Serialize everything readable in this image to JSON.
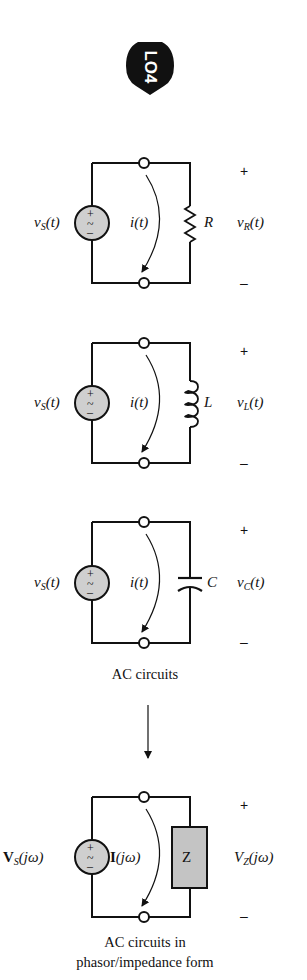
{
  "badge": {
    "label": "LO4",
    "icon": "learning-objective-arrow-icon"
  },
  "circuits": [
    {
      "type": "resistor",
      "source_label": {
        "main": "v",
        "sub": "S",
        "arg": "(t)"
      },
      "current_label": "i(t)",
      "element_label": "R",
      "voltage_label": {
        "main": "v",
        "sub": "R",
        "arg": "(t)"
      },
      "plus": "+",
      "minus": "–"
    },
    {
      "type": "inductor",
      "source_label": {
        "main": "v",
        "sub": "S",
        "arg": "(t)"
      },
      "current_label": "i(t)",
      "element_label": "L",
      "voltage_label": {
        "main": "v",
        "sub": "L",
        "arg": "(t)"
      },
      "plus": "+",
      "minus": "–"
    },
    {
      "type": "capacitor",
      "source_label": {
        "main": "v",
        "sub": "S",
        "arg": "(t)"
      },
      "current_label": "i(t)",
      "element_label": "C",
      "voltage_label": {
        "main": "v",
        "sub": "C",
        "arg": "(t)"
      },
      "plus": "+",
      "minus": "–"
    },
    {
      "type": "impedance",
      "source_label": {
        "main": "V",
        "sub": "S",
        "arg": "(jω)"
      },
      "current_label": {
        "main": "I",
        "arg": "(jω)"
      },
      "element_label": "Z",
      "voltage_label": {
        "main": "V",
        "sub": "Z",
        "arg": "(jω)"
      },
      "plus": "+",
      "minus": "–"
    }
  ],
  "captions": {
    "ac_circuits": "AC circuits",
    "phasor_line1": "AC circuits in",
    "phasor_line2": "phasor/impedance form"
  },
  "source_symbol": {
    "plus": "+",
    "tilde": "~",
    "minus": "–"
  },
  "colors": {
    "source_fill": "#cfcfcf",
    "impedance_fill": "#c4c4c4",
    "line": "#111111"
  }
}
